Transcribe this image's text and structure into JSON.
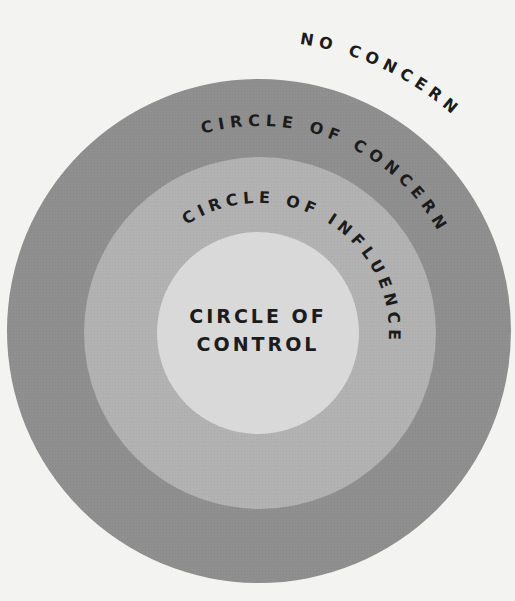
{
  "diagram": {
    "type": "concentric-circles",
    "labels": {
      "outside": "NO CONCERN",
      "outer_ring": "CIRCLE OF CONCERN",
      "middle_ring": "CIRCLE OF INFLUENCE",
      "inner_line1": "CIRCLE OF",
      "inner_line2": "CONTROL"
    },
    "colors": {
      "background": "#f3f3f1",
      "concern": "#8f8f8f",
      "influence": "#b2b2b2",
      "control": "#d9d9d9",
      "text": "#1c1c1c"
    }
  }
}
